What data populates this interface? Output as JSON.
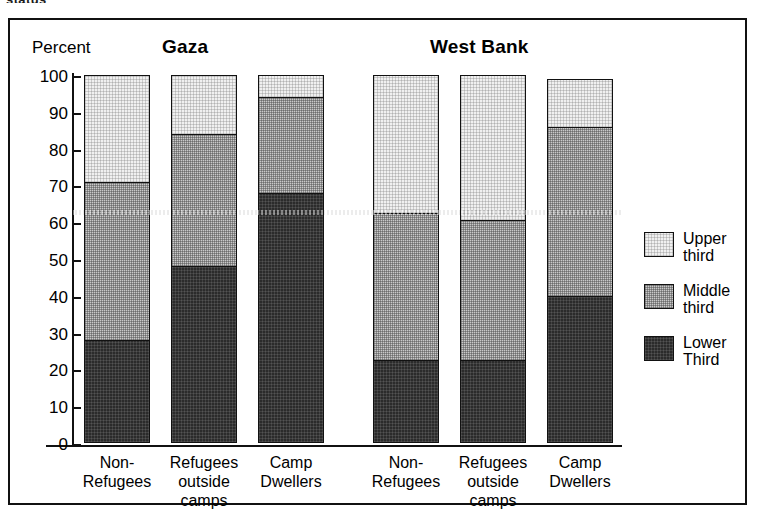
{
  "caption_fragment": "status",
  "figure": {
    "y_axis_title": "Percent",
    "group_titles": {
      "left": "Gaza",
      "right": "West Bank"
    }
  },
  "legend": {
    "items": [
      {
        "key": "upper",
        "label": "Upper\nthird",
        "color": "#f0f0f0",
        "swatch": "upper-third-swatch"
      },
      {
        "key": "middle",
        "label": "Middle\nthird",
        "color": "#c9c9c9",
        "swatch": "middle-third-swatch"
      },
      {
        "key": "lower",
        "label": "Lower\nThird",
        "color": "#2b2b2b",
        "swatch": "lower-third-swatch"
      }
    ]
  },
  "chart_data": {
    "type": "bar",
    "subtype": "stacked-vertical",
    "xlabel": "",
    "ylabel": "Percent",
    "ylim": [
      0,
      100
    ],
    "yticks": [
      0,
      10,
      20,
      30,
      40,
      50,
      60,
      70,
      80,
      90,
      100
    ],
    "ytick_labels": [
      "0",
      "10",
      "20",
      "30",
      "40",
      "50",
      "60",
      "70",
      "80",
      "90",
      "100"
    ],
    "grid": false,
    "legend_position": "right",
    "groups": [
      "Gaza",
      "West Bank"
    ],
    "categories": [
      "Non-\nRefugees",
      "Refugees\noutside\ncamps",
      "Camp\nDwellers",
      "Non-\nRefugees",
      "Refugees\noutside\ncamps",
      "Camp\nDwellers"
    ],
    "series": [
      {
        "name": "Lower Third",
        "color": "#2b2b2b",
        "values": [
          28,
          48,
          68,
          22.5,
          22.5,
          40
        ]
      },
      {
        "name": "Middle third",
        "color": "#c9c9c9",
        "values": [
          43,
          36,
          26,
          40,
          38,
          46
        ]
      },
      {
        "name": "Upper third",
        "color": "#f0f0f0",
        "values": [
          29,
          16,
          6,
          37.5,
          39.5,
          13
        ]
      }
    ],
    "cumulative_tops": {
      "lower": [
        28,
        48,
        68,
        22.5,
        22.5,
        40
      ],
      "middle": [
        71,
        84,
        94,
        62.5,
        60.5,
        86
      ],
      "upper": [
        100,
        100,
        100,
        100,
        100,
        99
      ]
    },
    "bars": [
      {
        "group": "Gaza",
        "category": "Non-\nRefugees",
        "lower": 28,
        "middle": 43,
        "upper": 29,
        "total": 100
      },
      {
        "group": "Gaza",
        "category": "Refugees\noutside\ncamps",
        "lower": 48,
        "middle": 36,
        "upper": 16,
        "total": 100
      },
      {
        "group": "Gaza",
        "category": "Camp\nDwellers",
        "lower": 68,
        "middle": 26,
        "upper": 6,
        "total": 100
      },
      {
        "group": "West Bank",
        "category": "Non-\nRefugees",
        "lower": 22.5,
        "middle": 40,
        "upper": 37.5,
        "total": 100
      },
      {
        "group": "West Bank",
        "category": "Refugees\noutside\ncamps",
        "lower": 22.5,
        "middle": 38,
        "upper": 39.5,
        "total": 100
      },
      {
        "group": "West Bank",
        "category": "Camp\nDwellers",
        "lower": 40,
        "middle": 46,
        "upper": 13,
        "total": 99
      }
    ]
  }
}
